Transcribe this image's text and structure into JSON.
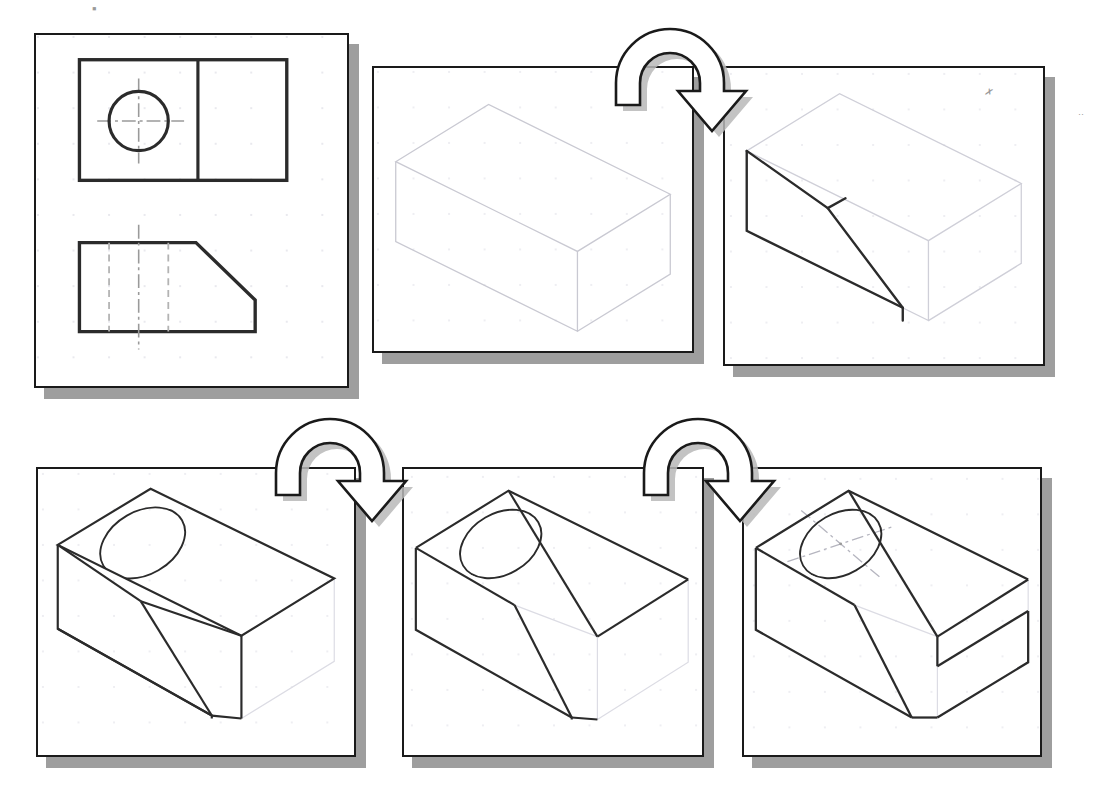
{
  "figure": {
    "background_color": "#ffffff",
    "line_color": "#1a1a1a",
    "construction_line_color": "#d8d8d8",
    "hidden_line_color": "#cfcfcf",
    "shadow_color": "#9e9e9e",
    "grid_dot_color": "#e2e2e8"
  },
  "steps": [
    {
      "id": "step-1",
      "name": "orthographic-views-panel",
      "label": "Step 1 — Given orthographic views",
      "content_type": "orthographic",
      "views": [
        {
          "name": "top-view",
          "description": "Rectangle divided by vertical line with circle and centerlines on left half",
          "features": [
            "outer-rectangle",
            "vertical-division-line",
            "circle",
            "horizontal-centerline",
            "vertical-centerline"
          ]
        },
        {
          "name": "front-view",
          "description": "Outline with chamfered / angled cut at upper right, two hidden lines for hole, vertical centerline",
          "features": [
            "outline-with-angled-cut",
            "hidden-line-left",
            "hidden-line-right",
            "vertical-centerline"
          ]
        }
      ]
    },
    {
      "id": "step-2",
      "name": "isometric-box-panel",
      "label": "Step 2 — Block out the enclosing isometric box",
      "content_type": "isometric",
      "line_weight": "construction",
      "features": [
        "isometric-bounding-box"
      ]
    },
    {
      "id": "step-3",
      "name": "angled-cut-panel",
      "label": "Step 3 — Lay out the inclined surface",
      "content_type": "isometric",
      "line_weight": "mixed",
      "features": [
        "isometric-bounding-box",
        "inclined-surface-outline"
      ]
    },
    {
      "id": "step-4",
      "name": "solid-with-hole-panel",
      "label": "Step 4 — Darken object lines and add the circle",
      "content_type": "isometric",
      "line_weight": "object",
      "features": [
        "solid-body",
        "inclined-face",
        "isometric-ellipse-hole"
      ]
    },
    {
      "id": "step-5",
      "name": "refined-solid-panel",
      "label": "Step 5 — Refine linework, remove excess construction",
      "content_type": "isometric",
      "line_weight": "object",
      "features": [
        "solid-body",
        "inclined-face",
        "isometric-ellipse-hole",
        "residual-construction-lines"
      ]
    },
    {
      "id": "step-6",
      "name": "finished-pictorial-panel",
      "label": "Step 6 — Finished isometric pictorial with centerlines",
      "content_type": "isometric",
      "line_weight": "object",
      "features": [
        "solid-body",
        "inclined-face",
        "isometric-ellipse-hole",
        "isometric-centerlines",
        "residual-construction-lines"
      ]
    }
  ],
  "arrows": [
    {
      "id": "arrow-1",
      "name": "step-arrow-1-to-2",
      "from": "step-2",
      "to": "step-3",
      "direction": "left-to-right",
      "style": "curved-u-turn-with-head"
    },
    {
      "id": "arrow-2",
      "name": "step-arrow-3-to-4",
      "from": "step-4",
      "to": "step-5",
      "direction": "left-to-right",
      "style": "curved-u-turn-with-head"
    },
    {
      "id": "arrow-3",
      "name": "step-arrow-5-to-6",
      "from": "step-5",
      "to": "step-6",
      "direction": "left-to-right",
      "style": "curved-u-turn-with-head"
    }
  ],
  "marks": [
    {
      "id": "speck-1",
      "name": "stray-pencil-mark-top",
      "glyph": "•"
    },
    {
      "id": "speck-2",
      "name": "stray-pencil-mark-panel3",
      "glyph": "✗"
    },
    {
      "id": "speck-3",
      "name": "stray-pencil-mark-right-edge",
      "glyph": "··"
    }
  ]
}
